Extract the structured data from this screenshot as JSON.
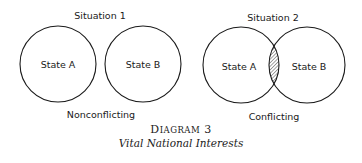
{
  "diagram": {
    "situation1": {
      "title": "Situation 1",
      "state_a": "State A",
      "state_b": "State B",
      "caption": "Nonconflicting"
    },
    "situation2": {
      "title": "Situation 2",
      "state_a": "State A",
      "state_b": "State B",
      "caption": "Conflicting",
      "overlap": "hatched"
    },
    "caption": {
      "label_first": "D",
      "label_rest": "IAGRAM",
      "number": "3",
      "title": "Vital National Interests"
    }
  }
}
